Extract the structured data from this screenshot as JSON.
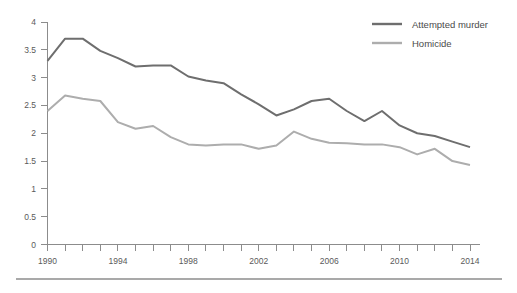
{
  "chart_data": {
    "type": "line",
    "title": "",
    "subtitle": "",
    "xlabel": "",
    "ylabel": "",
    "x": [
      1990,
      1991,
      1992,
      1993,
      1994,
      1995,
      1996,
      1997,
      1998,
      1999,
      2000,
      2001,
      2002,
      2003,
      2004,
      2005,
      2006,
      2007,
      2008,
      2009,
      2010,
      2011,
      2012,
      2013,
      2014
    ],
    "xlim": [
      1990,
      2014
    ],
    "ylim": [
      0,
      4
    ],
    "yticks": [
      0,
      0.5,
      1,
      1.5,
      2,
      2.5,
      3,
      3.5,
      4
    ],
    "ytick_labels": [
      "0",
      "0.5",
      "1",
      "1.5",
      "2",
      "2.5",
      "3",
      "3.5",
      "4"
    ],
    "xticks": [
      1990,
      1991,
      1992,
      1993,
      1994,
      1995,
      1996,
      1997,
      1998,
      1999,
      2000,
      2001,
      2002,
      2003,
      2004,
      2005,
      2006,
      2007,
      2008,
      2009,
      2010,
      2011,
      2012,
      2013,
      2014
    ],
    "xtick_labels_shown": [
      "1990",
      "1994",
      "1998",
      "2002",
      "2006",
      "2010",
      "2014"
    ],
    "xtick_label_values": [
      1990,
      1994,
      1998,
      2002,
      2006,
      2010,
      2014
    ],
    "grid": false,
    "legend_position": "top-right",
    "series": [
      {
        "name": "Attempted murder",
        "color": "#6e6e6e",
        "values": [
          3.3,
          3.7,
          3.7,
          3.48,
          3.35,
          3.2,
          3.22,
          3.22,
          3.02,
          2.95,
          2.9,
          2.7,
          2.52,
          2.32,
          2.43,
          2.58,
          2.62,
          2.4,
          2.22,
          2.4,
          2.14,
          2.0,
          1.95,
          1.85,
          1.75
        ]
      },
      {
        "name": "Homicide",
        "color": "#adadad",
        "values": [
          2.4,
          2.68,
          2.62,
          2.58,
          2.2,
          2.08,
          2.13,
          1.93,
          1.8,
          1.78,
          1.8,
          1.8,
          1.72,
          1.78,
          2.03,
          1.9,
          1.83,
          1.82,
          1.8,
          1.8,
          1.75,
          1.62,
          1.72,
          1.5,
          1.43
        ]
      }
    ]
  },
  "legend": {
    "items": [
      {
        "label": "Attempted murder",
        "color": "#6e6e6e"
      },
      {
        "label": "Homicide",
        "color": "#adadad"
      }
    ]
  },
  "axes": {
    "y_tick_labels": [
      "4",
      "3.5",
      "3",
      "2.5",
      "2",
      "1.5",
      "1",
      "0.5",
      "0"
    ],
    "x_tick_labels": [
      "1990",
      "1994",
      "1998",
      "2002",
      "2006",
      "2010",
      "2014"
    ]
  },
  "colors": {
    "attempted_murder": "#6e6e6e",
    "homicide": "#adadad",
    "axis": "#8c8c8c",
    "rule": "#8d8d8d",
    "background": "#ffffff"
  }
}
